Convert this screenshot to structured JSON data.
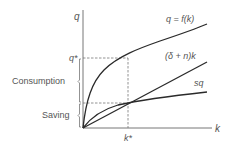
{
  "diagram": {
    "axes": {
      "y_label": "q",
      "x_label": "k"
    },
    "curves": {
      "production": "q = f(k)",
      "depreciation": "(δ + n)k",
      "saving": "sq"
    },
    "markers": {
      "q_star": "q*",
      "k_star": "k*"
    },
    "brackets": {
      "consumption": "Consumption",
      "saving": "Saving"
    },
    "colors": {
      "curve": "#2a2a2a",
      "axis": "#555555",
      "text": "#555555",
      "dashed": "#777777"
    }
  }
}
